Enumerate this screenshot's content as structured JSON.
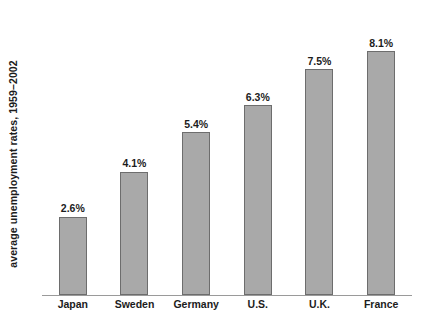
{
  "chart_data": {
    "type": "bar",
    "title": "",
    "xlabel": "",
    "ylabel": "average unemployment rates, 1959–2002",
    "categories": [
      "Japan",
      "Sweden",
      "Germany",
      "U.S.",
      "U.K.",
      "France"
    ],
    "values": [
      2.6,
      4.1,
      5.4,
      6.3,
      7.5,
      8.1
    ],
    "value_labels": [
      "2.6%",
      "4.1%",
      "5.4%",
      "6.3%",
      "7.5%",
      "8.1%"
    ],
    "ylim": [
      0,
      8.9
    ],
    "grid": false,
    "legend": null,
    "bar_color": "#a9a9a9",
    "bar_border_color": "#6d6d6d",
    "axis_color": "#9a9a9a",
    "text_color": "#1c1c1c",
    "background_color": "#ffffff"
  }
}
